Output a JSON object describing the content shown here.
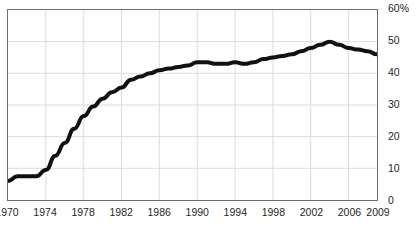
{
  "chart_data": {
    "type": "line",
    "title": "",
    "subtitle": "",
    "xlabel": "",
    "ylabel": "",
    "xlim": [
      1970,
      2009
    ],
    "ylim": [
      0,
      60
    ],
    "grid": true,
    "legend": null,
    "x_tick_labels": [
      "1970",
      "1974",
      "1978",
      "1982",
      "1986",
      "1990",
      "1994",
      "1998",
      "2002",
      "2006",
      "2009"
    ],
    "x_tick_values": [
      1970,
      1974,
      1978,
      1982,
      1986,
      1990,
      1994,
      1998,
      2002,
      2006,
      2009
    ],
    "y_tick_labels": [
      "60%",
      "50",
      "40",
      "30",
      "20",
      "10",
      "0"
    ],
    "y_tick_values": [
      60,
      50,
      40,
      30,
      20,
      10,
      0
    ],
    "series": [
      {
        "name": "",
        "color": "#111111",
        "line_width": 4,
        "x": [
          1970,
          1971,
          1972,
          1973,
          1974,
          1975,
          1976,
          1977,
          1978,
          1979,
          1980,
          1981,
          1982,
          1983,
          1984,
          1985,
          1986,
          1987,
          1988,
          1989,
          1990,
          1991,
          1992,
          1993,
          1994,
          1995,
          1996,
          1997,
          1998,
          1999,
          2000,
          2001,
          2002,
          2003,
          2004,
          2005,
          2006,
          2007,
          2008,
          2009
        ],
        "values": [
          6,
          7.5,
          7.5,
          7.5,
          9.5,
          14,
          18,
          22.5,
          26.5,
          29.5,
          32,
          34,
          35.5,
          38,
          39,
          40,
          41,
          41.5,
          42,
          42.5,
          43.5,
          43.5,
          43,
          43,
          43.5,
          43,
          43.5,
          44.5,
          45,
          45.5,
          46,
          47,
          48,
          49,
          50,
          49,
          48,
          47.5,
          47,
          46
        ]
      }
    ]
  }
}
